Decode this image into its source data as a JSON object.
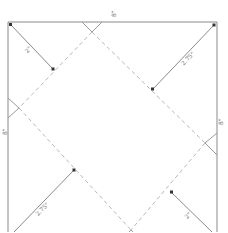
{
  "diagram": {
    "title": "",
    "colors": {
      "frame": "#8a8a8a",
      "fold_line": "#b8b8b8",
      "arrow": "#8a8a8a",
      "arrowhead": "#333333",
      "label": "#666666"
    },
    "edge_labels": {
      "top": "8\"",
      "left": "8\"",
      "right": "8\""
    },
    "arrow_labels": {
      "top_left": "2\"",
      "top_right": "2.75\"",
      "bottom_left": "2.75\"",
      "bottom_right": "2\""
    }
  }
}
